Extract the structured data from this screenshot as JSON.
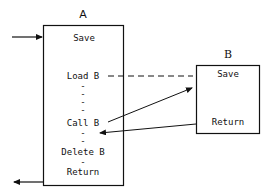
{
  "diagram": {
    "procedure_a": {
      "title": "A",
      "steps": [
        "Save",
        "Load B",
        "Call B",
        "Delete B",
        "Return"
      ],
      "dash_marker": "-"
    },
    "procedure_b": {
      "title": "B",
      "steps": [
        "Save",
        "Return"
      ]
    },
    "edges": [
      {
        "from": "external",
        "to": "A",
        "type": "arrow",
        "role": "entry"
      },
      {
        "from": "A.Load B",
        "to": "B",
        "type": "dashed-line",
        "role": "load"
      },
      {
        "from": "A.Call B",
        "to": "B",
        "type": "arrow",
        "role": "call"
      },
      {
        "from": "B.Return",
        "to": "A",
        "type": "arrow",
        "role": "return"
      },
      {
        "from": "A",
        "to": "external",
        "type": "arrow",
        "role": "exit"
      }
    ],
    "colors": {
      "stroke": "#111111",
      "background": "#ffffff"
    }
  }
}
